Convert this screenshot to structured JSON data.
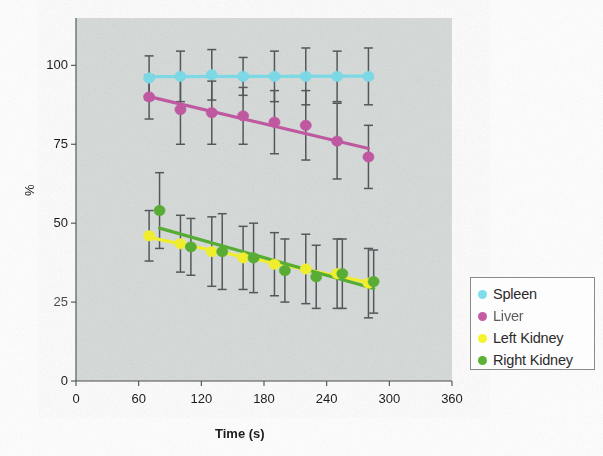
{
  "chart_data": {
    "type": "scatter",
    "title": "",
    "xlabel": "Time (s)",
    "ylabel": "%",
    "xlim": [
      0,
      360
    ],
    "ylim": [
      0,
      115
    ],
    "xticks": [
      0,
      60,
      120,
      180,
      240,
      300,
      360
    ],
    "yticks": [
      0,
      25,
      50,
      75,
      100
    ],
    "grid": false,
    "legend_position": "right-outside",
    "plot_background": "#d9dedd",
    "error_bars": true,
    "trendlines": true,
    "series": [
      {
        "name": "Spleen",
        "color": "#7fdeeb",
        "x": [
          70,
          100,
          130,
          160,
          190,
          220,
          250,
          280
        ],
        "values": [
          96,
          96.5,
          97,
          96.5,
          96.5,
          96.5,
          96.5,
          96.5
        ],
        "errors": [
          7,
          8,
          8,
          6,
          8,
          9,
          8,
          9
        ]
      },
      {
        "name": "Liver",
        "color": "#c45ba4",
        "x": [
          70,
          100,
          130,
          160,
          190,
          220,
          250,
          280
        ],
        "values": [
          90,
          86,
          85,
          84,
          82,
          81,
          76,
          71
        ],
        "errors": [
          7,
          11,
          10,
          9,
          10,
          11,
          12,
          10
        ]
      },
      {
        "name": "Left Kidney",
        "color": "#f5f32e",
        "x": [
          70,
          100,
          130,
          160,
          190,
          220,
          250,
          280
        ],
        "values": [
          46,
          43.5,
          41,
          39,
          37,
          35.5,
          34,
          31
        ],
        "errors": [
          8,
          9,
          11,
          10,
          10,
          11,
          11,
          11
        ]
      },
      {
        "name": "Right Kidney",
        "color": "#5ab135",
        "x": [
          80,
          110,
          140,
          170,
          200,
          230,
          255,
          285
        ],
        "values": [
          54,
          42.5,
          41,
          39,
          35,
          33,
          34,
          31.5
        ],
        "errors": [
          12,
          9,
          12,
          11,
          10,
          10,
          11,
          10
        ]
      }
    ]
  },
  "axes": {
    "y_title": "%",
    "x_title": "Time (s)",
    "y_tick_labels": [
      "0",
      "25",
      "50",
      "75",
      "100"
    ],
    "x_tick_labels": [
      "0",
      "60",
      "120",
      "180",
      "240",
      "300",
      "360"
    ]
  },
  "legend": {
    "items": [
      {
        "label": "Spleen",
        "color": "#7fdeeb",
        "degraded": false
      },
      {
        "label": "Liver",
        "color": "#c45ba4",
        "degraded": true
      },
      {
        "label": "Left Kidney",
        "color": "#f5f32e",
        "degraded": false
      },
      {
        "label": "Right Kidney",
        "color": "#5ab135",
        "degraded": false
      }
    ]
  }
}
